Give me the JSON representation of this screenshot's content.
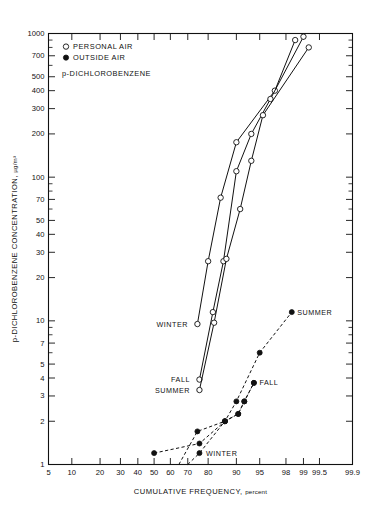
{
  "figure": {
    "background": "#ffffff",
    "ink": "#111111"
  },
  "legend": {
    "entries": [
      {
        "marker": "open-circle",
        "label": "PERSONAL AIR"
      },
      {
        "marker": "filled-circle",
        "label": "OUTSIDE AIR"
      }
    ],
    "compound": "p-DICHLOROBENZENE"
  },
  "axes": {
    "y_title_main": "p-DICHLOROBENZENE CONCENTRATION,",
    "y_title_units": "µg/m³",
    "x_title_main": "CUMULATIVE FREQUENCY,",
    "x_title_units": "percent",
    "y_ticks": [
      1,
      2,
      3,
      4,
      5,
      7,
      10,
      20,
      30,
      40,
      50,
      70,
      100,
      200,
      300,
      400,
      500,
      700,
      1000
    ],
    "y_tick_labels": [
      "1",
      "2",
      "3",
      "4",
      "5",
      "7",
      "10",
      "20",
      "30",
      "40",
      "50",
      "70",
      "100",
      "200",
      "300",
      "400",
      "500",
      "700",
      "1000"
    ],
    "x_ticks": [
      5,
      10,
      20,
      30,
      40,
      50,
      60,
      70,
      80,
      90,
      95,
      98,
      99,
      99.5,
      99.9
    ],
    "x_tick_labels": [
      "5",
      "10",
      "20",
      "30",
      "40",
      "50",
      "60",
      "70",
      "80",
      "90",
      "95",
      "98",
      "99",
      "99.5",
      "99.9"
    ],
    "y_scale": "log",
    "x_scale": "probability",
    "ylim": [
      1,
      1000
    ],
    "xlim": [
      5,
      99.9
    ]
  },
  "chart_data": {
    "type": "line",
    "title": "p-DICHLOROBENZENE",
    "xlabel": "CUMULATIVE FREQUENCY, percent",
    "ylabel": "p-DICHLOROBENZENE CONCENTRATION, µg/m³",
    "x_scale": "probability",
    "y_scale": "log",
    "xlim": [
      5,
      99.9
    ],
    "ylim": [
      1,
      1000
    ],
    "grid": false,
    "legend_position": "upper-left",
    "annotations": [
      {
        "text": "WINTER",
        "series": "Personal air – Winter",
        "x": 73,
        "y": 9.5,
        "anchor": "right"
      },
      {
        "text": "FALL",
        "series": "Personal air – Fall",
        "x": 74,
        "y": 3.9,
        "anchor": "right"
      },
      {
        "text": "SUMMER",
        "series": "Personal air – Summer",
        "x": 74,
        "y": 3.3,
        "anchor": "right"
      },
      {
        "text": "SUMMER",
        "series": "Outside air – Summer",
        "x": 98.4,
        "y": 11.5,
        "anchor": "left"
      },
      {
        "text": "FALL",
        "series": "Outside air – Fall",
        "x": 94,
        "y": 3.7,
        "anchor": "left"
      },
      {
        "text": "WINTER",
        "series": "Outside air – Winter",
        "x": 76.5,
        "y": 1.2,
        "anchor": "left"
      }
    ],
    "series": [
      {
        "name": "Personal air – Winter",
        "marker": "open-circle",
        "line": "solid",
        "points": [
          [
            75,
            9.5
          ],
          [
            80,
            26
          ],
          [
            85,
            72
          ],
          [
            90,
            175
          ],
          [
            97,
            400
          ],
          [
            98.6,
            900
          ]
        ]
      },
      {
        "name": "Personal air – Fall",
        "marker": "open-circle",
        "line": "solid",
        "points": [
          [
            76,
            3.9
          ],
          [
            82,
            11.5
          ],
          [
            86,
            26
          ],
          [
            90,
            110
          ],
          [
            93.5,
            200
          ],
          [
            96.5,
            350
          ],
          [
            99,
            950
          ]
        ]
      },
      {
        "name": "Personal air – Summer",
        "marker": "open-circle",
        "line": "solid",
        "points": [
          [
            76,
            3.3
          ],
          [
            82.5,
            9.7
          ],
          [
            87,
            27
          ],
          [
            91,
            60
          ],
          [
            93.5,
            130
          ],
          [
            95.5,
            270
          ],
          [
            99.2,
            800
          ]
        ]
      },
      {
        "name": "Outside air – Summer",
        "marker": "filled-circle",
        "line": "dashed",
        "points": [
          [
            50,
            1.2
          ],
          [
            76,
            1.4
          ],
          [
            86.5,
            2.0
          ],
          [
            90,
            2.75
          ],
          [
            95,
            6.0
          ],
          [
            98.4,
            11.5
          ]
        ]
      },
      {
        "name": "Outside air – Fall",
        "marker": "filled-circle",
        "line": "dashed",
        "points": [
          [
            65,
            1.0
          ],
          [
            75,
            1.7
          ],
          [
            86.5,
            2.0
          ],
          [
            90.5,
            2.25
          ],
          [
            92,
            2.75
          ],
          [
            94,
            3.7
          ]
        ]
      },
      {
        "name": "Outside air – Winter",
        "marker": "filled-circle",
        "line": "dashed",
        "points": [
          [
            70,
            1.0
          ],
          [
            76,
            1.2
          ],
          [
            86.5,
            2.0
          ],
          [
            90.5,
            2.25
          ],
          [
            92,
            2.75
          ],
          [
            94,
            3.7
          ]
        ]
      }
    ]
  }
}
